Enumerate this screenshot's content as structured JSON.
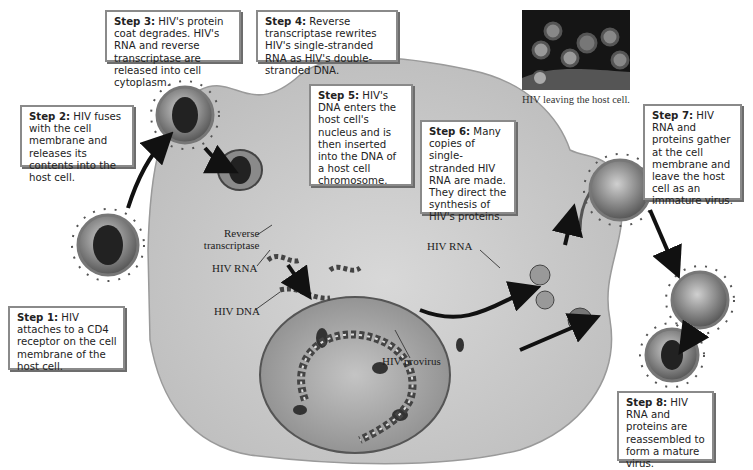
{
  "diagram": {
    "steps": [
      {
        "id": "step1",
        "label": "Step 1:",
        "text": " HIV attaches to a CD4 receptor on the cell membrane of the host cell."
      },
      {
        "id": "step2",
        "label": "Step 2:",
        "text": " HIV fuses with the cell membrane and releases its contents into the host cell."
      },
      {
        "id": "step3",
        "label": "Step 3:",
        "text": " HIV's protein coat degrades. HIV's RNA and reverse transcriptase are released into cell cytoplasm."
      },
      {
        "id": "step4",
        "label": "Step 4:",
        "text": " Reverse transcriptase rewrites HIV's single-stranded RNA as HIV's double-stranded DNA."
      },
      {
        "id": "step5",
        "label": "Step 5:",
        "text": " HIV's DNA enters the host cell's nucleus and is then inserted into the DNA of a host cell chromosome."
      },
      {
        "id": "step6",
        "label": "Step 6:",
        "text": " Many copies of single-stranded HIV RNA are made. They direct the synthesis of HIV's proteins."
      },
      {
        "id": "step7",
        "label": "Step 7:",
        "text": " HIV RNA and proteins gather at the cell membrane and leave the host cell as an immature virus."
      },
      {
        "id": "step8",
        "label": "Step 8:",
        "text": " HIV RNA and proteins are reassembled to form a mature virus."
      }
    ],
    "labels": {
      "reverse_transcriptase_1": "Reverse",
      "reverse_transcriptase_2": "transcriptase",
      "hiv_rna": "HIV RNA",
      "hiv_dna": "HIV DNA",
      "hiv_provirus": "HIV provirus",
      "hiv_rna_nucleus": "HIV RNA"
    },
    "photo_caption": "HIV leaving the host cell.",
    "colors": {
      "cell": "#c9c9c9",
      "nucleus": "#a9a9a9",
      "box_border": "#8a8a8a",
      "arrow": "#111111"
    }
  }
}
